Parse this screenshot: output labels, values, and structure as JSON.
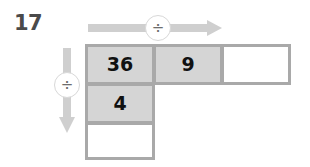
{
  "problem": {
    "number": "17"
  },
  "operators": {
    "horizontal": {
      "symbol": "÷",
      "icon": "divide-icon",
      "direction": "right"
    },
    "vertical": {
      "symbol": "÷",
      "icon": "divide-icon",
      "direction": "down"
    }
  },
  "grid": {
    "cells": [
      {
        "id": "r1c1",
        "value": "36",
        "filled": true
      },
      {
        "id": "r1c2",
        "value": "9",
        "filled": true
      },
      {
        "id": "r1c3",
        "value": "",
        "filled": false
      },
      {
        "id": "r2c1",
        "value": "4",
        "filled": true
      },
      {
        "id": "r3c1",
        "value": "",
        "filled": false
      }
    ]
  },
  "colors": {
    "cell_fill": "#d5d5d5",
    "cell_blank": "#ffffff",
    "cell_border": "#a9a9a9",
    "arrow": "#cfcfcf",
    "number_label": "#4a4a4a",
    "cell_text": "#111111",
    "badge_border": "#d8d8d8",
    "badge_text": "#6d6d6d"
  }
}
